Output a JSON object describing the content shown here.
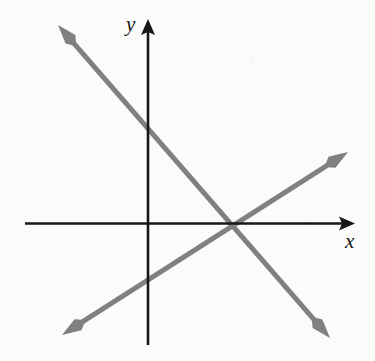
{
  "figure": {
    "width": 375,
    "height": 361,
    "background_color": "#fbfbfa",
    "axis_color": "#171717",
    "line_color": "#808080"
  },
  "axes": {
    "x_label": "x",
    "y_label": "y",
    "origin": {
      "x": 148,
      "y": 224
    },
    "x_axis": {
      "start_x": 25,
      "end_x": 355,
      "y": 224,
      "arrow_at": "end"
    },
    "y_axis": {
      "x": 148,
      "start_y": 345,
      "end_y": 20,
      "arrow_at": "top"
    }
  },
  "chart_data": {
    "type": "line",
    "title": "",
    "xlabel": "x",
    "ylabel": "y",
    "grid": false,
    "legend": "none",
    "axis_style": "arrowed-cartesian-axes",
    "origin_px": {
      "x": 148,
      "y": 224
    },
    "units_per_px": null,
    "series": [
      {
        "name": "descending-line",
        "direction": "decreasing",
        "slope_sign": "negative",
        "arrowheads": "both-ends",
        "color": "#808080",
        "points_px": [
          {
            "x": 58,
            "y": 25
          },
          {
            "x": 330,
            "y": 338
          }
        ],
        "y_intercept_px": {
          "x": 148,
          "y": 122
        },
        "x_intercept_px": {
          "x": 238,
          "y": 224
        }
      },
      {
        "name": "ascending-line",
        "direction": "increasing",
        "slope_sign": "positive",
        "arrowheads": "both-ends",
        "color": "#808080",
        "points_px": [
          {
            "x": 62,
            "y": 335
          },
          {
            "x": 348,
            "y": 152
          }
        ],
        "y_intercept_px": {
          "x": 148,
          "y": 280
        },
        "x_intercept_px": {
          "x": 238,
          "y": 224
        }
      }
    ],
    "annotations": [
      {
        "name": "intersection",
        "x_px": 238,
        "y_px": 224,
        "note": "both lines cross each other on the positive x-axis"
      }
    ]
  }
}
